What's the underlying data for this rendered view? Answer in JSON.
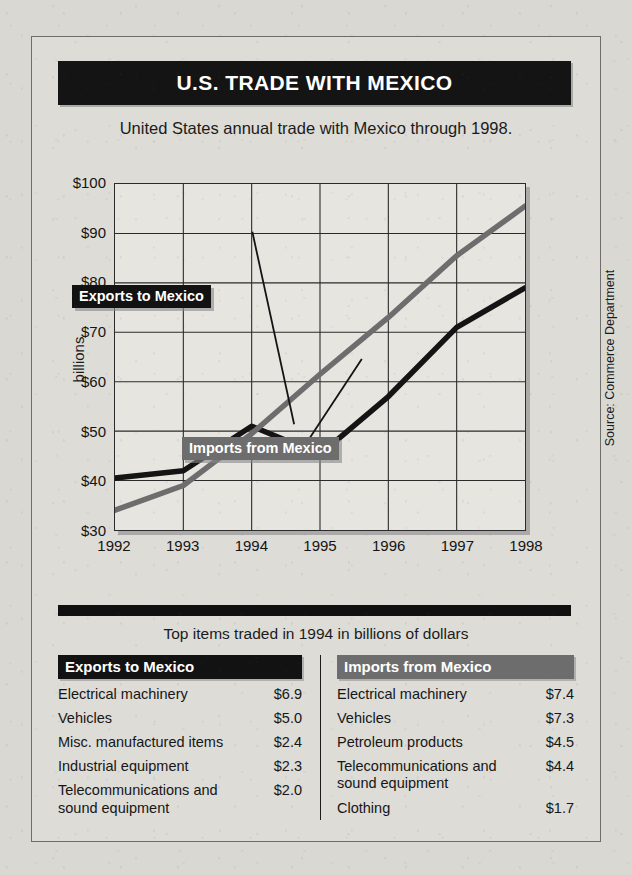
{
  "header": {
    "title": "U.S. TRADE WITH MEXICO",
    "subtitle": "United States annual trade with Mexico through 1998."
  },
  "chart_data": {
    "type": "line",
    "title": "U.S. TRADE WITH MEXICO",
    "subtitle": "United States annual trade with Mexico through 1998.",
    "xlabel": "",
    "ylabel": "billions",
    "x": [
      1992,
      1993,
      1994,
      1995,
      1996,
      1997,
      1998
    ],
    "xticklabels": [
      "1992",
      "1993",
      "1994",
      "1995",
      "1996",
      "1997",
      "1998"
    ],
    "yticklabels": [
      "$30",
      "$40",
      "$50",
      "$60",
      "$70",
      "$80",
      "$90",
      "$100"
    ],
    "ylim": [
      30,
      100
    ],
    "ytick_step": 10,
    "grid": true,
    "legend_position": "in-plot-callouts",
    "series": [
      {
        "name": "Exports to Mexico",
        "color": "#141414",
        "values": [
          40.5,
          42.0,
          51.0,
          45.3,
          57.0,
          71.0,
          79.0
        ]
      },
      {
        "name": "Imports from Mexico",
        "color": "#6d6d6d",
        "values": [
          34.0,
          39.0,
          49.5,
          61.5,
          73.0,
          85.5,
          95.5
        ]
      }
    ],
    "annotations": [
      "Exports to Mexico",
      "Imports from Mexico"
    ],
    "source": "Source: Commerce Department"
  },
  "tables": {
    "caption": "Top items traded in 1994 in billions of dollars",
    "exports": {
      "header": "Exports to Mexico",
      "rows": [
        {
          "name": "Electrical machinery",
          "value": "$6.9",
          "cont": ""
        },
        {
          "name": "Vehicles",
          "value": "$5.0",
          "cont": ""
        },
        {
          "name": "Misc. manufactured items",
          "value": "$2.4",
          "cont": ""
        },
        {
          "name": "Industrial equipment",
          "value": "$2.3",
          "cont": ""
        },
        {
          "name": "Telecommunications and",
          "value": "$2.0",
          "cont": "sound equipment"
        }
      ]
    },
    "imports": {
      "header": "Imports from Mexico",
      "rows": [
        {
          "name": "Electrical machinery",
          "value": "$7.4",
          "cont": ""
        },
        {
          "name": "Vehicles",
          "value": "$7.3",
          "cont": ""
        },
        {
          "name": "Petroleum products",
          "value": "$4.5",
          "cont": ""
        },
        {
          "name": "Telecommunications and",
          "value": "$4.4",
          "cont": "sound equipment"
        },
        {
          "name": "Clothing",
          "value": "$1.7",
          "cont": ""
        }
      ]
    }
  }
}
